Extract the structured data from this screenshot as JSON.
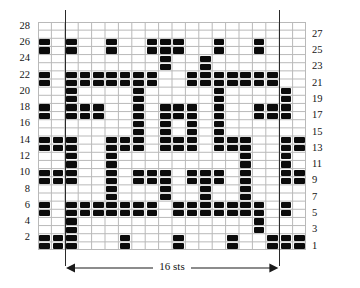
{
  "chart": {
    "type": "knitting-chart",
    "columns": 20,
    "rows": 28,
    "cell_color": "#0b0b0b",
    "grid_line_color": "#b9b9b9",
    "border_color": "#b9b9b9",
    "repeat_line_color": "#2a2a2a",
    "repeat_start_column": 2,
    "repeat_end_column": 18,
    "width_label": "16 sts",
    "row_numbers_left": [
      28,
      26,
      24,
      22,
      20,
      18,
      16,
      14,
      12,
      10,
      8,
      6,
      4,
      2
    ],
    "row_numbers_right": [
      27,
      25,
      23,
      21,
      19,
      17,
      15,
      13,
      11,
      9,
      7,
      5,
      3,
      1
    ],
    "filled_cells": [
      {
        "row": 28,
        "cols": []
      },
      {
        "row": 27,
        "cols": []
      },
      {
        "row": 26,
        "cols": [
          1,
          3,
          6,
          9,
          10,
          11,
          14,
          17
        ]
      },
      {
        "row": 25,
        "cols": [
          1,
          3,
          6,
          9,
          10,
          11,
          14,
          17
        ]
      },
      {
        "row": 24,
        "cols": [
          10,
          13
        ]
      },
      {
        "row": 23,
        "cols": [
          10,
          13
        ]
      },
      {
        "row": 22,
        "cols": [
          1,
          3,
          4,
          5,
          6,
          7,
          8,
          9,
          12,
          13,
          14,
          15,
          16,
          17,
          18
        ]
      },
      {
        "row": 21,
        "cols": [
          1,
          3,
          4,
          5,
          6,
          7,
          8,
          9,
          12,
          13,
          14,
          15,
          16,
          17,
          18
        ]
      },
      {
        "row": 20,
        "cols": [
          3,
          8,
          14,
          19
        ]
      },
      {
        "row": 19,
        "cols": [
          3,
          8,
          14,
          19
        ]
      },
      {
        "row": 18,
        "cols": [
          1,
          3,
          4,
          5,
          8,
          10,
          11,
          12,
          14,
          17,
          18,
          19
        ]
      },
      {
        "row": 17,
        "cols": [
          1,
          3,
          4,
          5,
          8,
          10,
          11,
          12,
          14,
          17,
          18,
          19
        ]
      },
      {
        "row": 16,
        "cols": [
          8,
          10,
          12,
          14
        ]
      },
      {
        "row": 15,
        "cols": [
          8,
          10,
          12,
          14
        ]
      },
      {
        "row": 14,
        "cols": [
          1,
          2,
          3,
          6,
          7,
          8,
          10,
          11,
          12,
          14,
          15,
          16,
          19,
          20
        ]
      },
      {
        "row": 13,
        "cols": [
          1,
          2,
          3,
          6,
          7,
          8,
          10,
          11,
          12,
          14,
          15,
          16,
          19,
          20
        ]
      },
      {
        "row": 12,
        "cols": [
          3,
          6,
          16,
          19
        ]
      },
      {
        "row": 11,
        "cols": [
          3,
          6,
          16,
          19
        ]
      },
      {
        "row": 10,
        "cols": [
          1,
          2,
          3,
          6,
          8,
          9,
          10,
          12,
          13,
          14,
          16,
          19,
          20
        ]
      },
      {
        "row": 9,
        "cols": [
          1,
          2,
          3,
          6,
          8,
          9,
          10,
          12,
          13,
          14,
          16,
          19,
          20
        ]
      },
      {
        "row": 8,
        "cols": [
          6,
          10,
          13,
          16
        ]
      },
      {
        "row": 7,
        "cols": [
          6,
          10,
          13,
          16
        ]
      },
      {
        "row": 6,
        "cols": [
          1,
          3,
          4,
          5,
          6,
          7,
          8,
          9,
          11,
          12,
          13,
          14,
          15,
          16,
          17,
          19
        ]
      },
      {
        "row": 5,
        "cols": [
          1,
          3,
          4,
          5,
          6,
          7,
          8,
          9,
          11,
          12,
          13,
          14,
          15,
          16,
          17,
          19
        ]
      },
      {
        "row": 4,
        "cols": [
          3,
          17
        ]
      },
      {
        "row": 3,
        "cols": [
          3,
          17
        ]
      },
      {
        "row": 2,
        "cols": [
          1,
          2,
          3,
          7,
          11,
          15,
          18,
          19,
          20
        ]
      },
      {
        "row": 1,
        "cols": [
          1,
          2,
          3,
          7,
          11,
          15,
          18,
          19,
          20
        ]
      }
    ]
  }
}
